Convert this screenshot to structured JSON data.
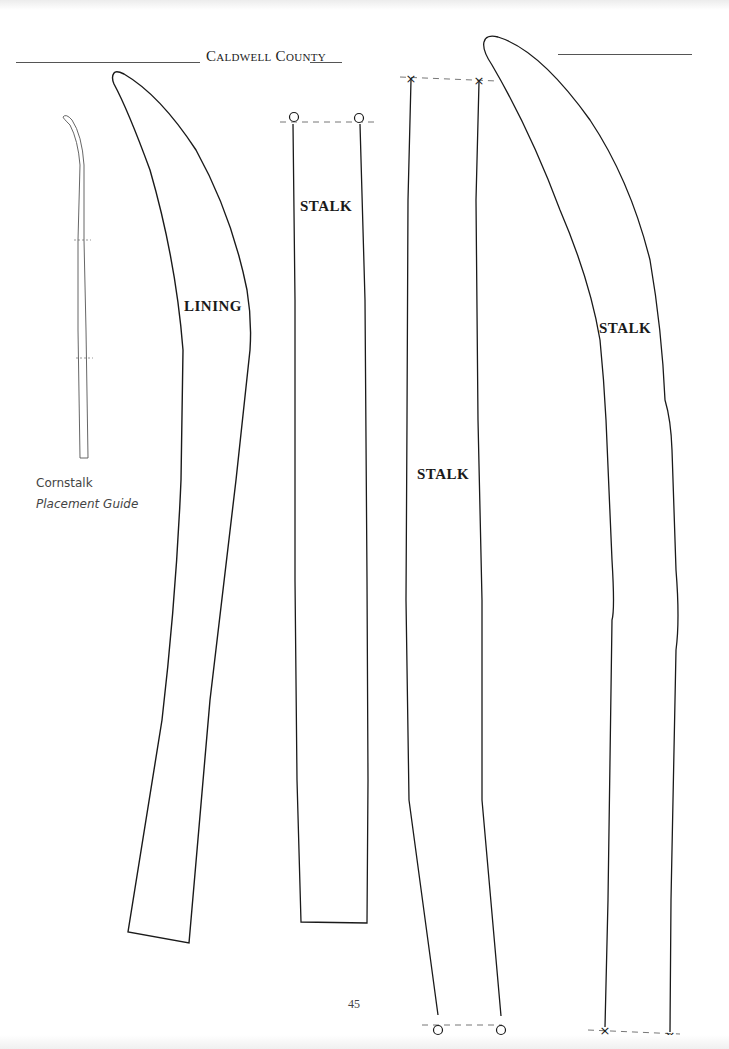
{
  "page": {
    "header": "Caldwell County",
    "page_number": "45"
  },
  "placement_guide": {
    "line1": "Cornstalk",
    "line2": "Placement Guide"
  },
  "pieces": [
    {
      "label": "LINING"
    },
    {
      "label": "STALK"
    },
    {
      "label": "STALK"
    },
    {
      "label": "STALK"
    }
  ],
  "markers": {
    "circle_marker": "registration-circle",
    "cross_marker": "registration-cross"
  },
  "colors": {
    "outline": "#1a1a1a",
    "dashed": "#777777",
    "guide": "#555555"
  }
}
